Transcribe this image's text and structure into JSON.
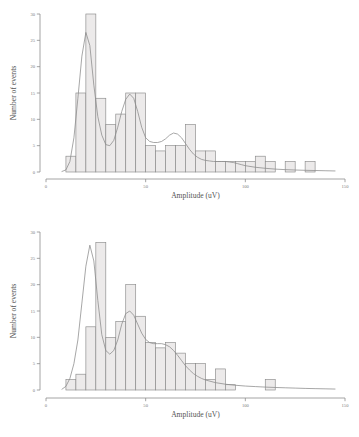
{
  "figure": {
    "background": "#ffffff",
    "bar_fill": "#ecebeb",
    "bar_stroke": "#8a8a8a",
    "curve_stroke": "#8a8a8a",
    "axis_color": "#8d8d8d"
  },
  "chart_data": [
    {
      "type": "bar",
      "id": "histogram-top",
      "title": "",
      "xlabel": "Amplitude (uV)",
      "ylabel": "Number of events",
      "xlim": [
        0,
        150
      ],
      "ylim": [
        0,
        30
      ],
      "xticks": [
        0,
        50,
        100,
        150
      ],
      "xtick_labels": [
        "0",
        "50",
        "100",
        "150"
      ],
      "yticks": [
        0,
        5,
        10,
        15,
        20,
        25,
        30
      ],
      "ytick_labels": [
        "0",
        "5",
        "10",
        "15",
        "20",
        "25",
        "30"
      ],
      "grid": false,
      "legend": "none",
      "bin_width": 5,
      "bin_starts": [
        10,
        15,
        20,
        25,
        30,
        35,
        40,
        45,
        50,
        55,
        60,
        65,
        70,
        75,
        80,
        85,
        90,
        95,
        100,
        105,
        110,
        115,
        120,
        125,
        130
      ],
      "categories": [
        "10-15",
        "15-20",
        "20-25",
        "25-30",
        "30-35",
        "35-40",
        "40-45",
        "45-50",
        "50-55",
        "55-60",
        "60-65",
        "65-70",
        "70-75",
        "75-80",
        "80-85",
        "85-90",
        "90-95",
        "95-100",
        "100-105",
        "105-110",
        "110-115",
        "115-120",
        "120-125",
        "125-130",
        "130-135"
      ],
      "values": [
        3,
        15,
        30,
        14,
        9,
        11,
        15,
        15,
        5,
        4,
        5,
        5,
        9,
        4,
        4,
        2,
        2,
        2,
        2,
        3,
        2,
        0,
        2,
        0,
        2
      ],
      "overlay_curve": {
        "name": "kernel density estimate",
        "x": [
          8,
          10,
          12,
          14,
          16,
          18,
          20,
          22,
          24,
          26,
          28,
          30,
          32,
          34,
          36,
          38,
          40,
          42,
          44,
          46,
          48,
          50,
          52,
          54,
          56,
          58,
          60,
          62,
          64,
          66,
          68,
          70,
          72,
          74,
          76,
          78,
          80,
          82,
          84,
          86,
          88,
          90,
          92,
          94,
          96,
          98,
          100,
          105,
          110,
          115,
          120,
          125,
          130,
          135,
          140,
          145
        ],
        "y": [
          0.1,
          0.4,
          2.0,
          6.5,
          14.0,
          22.0,
          26.5,
          24.0,
          16.5,
          10.5,
          7.0,
          5.2,
          5.0,
          6.0,
          8.5,
          11.5,
          13.8,
          14.8,
          14.0,
          11.5,
          8.5,
          6.5,
          5.8,
          5.6,
          5.6,
          5.8,
          6.3,
          7.0,
          7.4,
          7.2,
          6.5,
          5.4,
          4.3,
          3.4,
          2.8,
          2.4,
          2.2,
          2.1,
          2.0,
          2.0,
          2.0,
          2.0,
          1.9,
          1.8,
          1.6,
          1.4,
          1.2,
          0.9,
          0.7,
          0.55,
          0.45,
          0.38,
          0.32,
          0.28,
          0.24,
          0.2
        ]
      }
    },
    {
      "type": "bar",
      "id": "histogram-bottom",
      "title": "",
      "xlabel": "Amplitude (uV)",
      "ylabel": "Number of events",
      "xlim": [
        0,
        150
      ],
      "ylim": [
        0,
        30
      ],
      "xticks": [
        0,
        50,
        100,
        150
      ],
      "xtick_labels": [
        "0",
        "50",
        "100",
        "150"
      ],
      "yticks": [
        0,
        5,
        10,
        15,
        20,
        25,
        30
      ],
      "ytick_labels": [
        "0",
        "5",
        "10",
        "15",
        "20",
        "25",
        "30"
      ],
      "grid": false,
      "legend": "none",
      "bin_width": 5,
      "bin_starts": [
        10,
        15,
        20,
        25,
        30,
        35,
        40,
        45,
        50,
        55,
        60,
        65,
        70,
        75,
        80,
        85,
        90,
        110
      ],
      "categories": [
        "10-15",
        "15-20",
        "20-25",
        "25-30",
        "30-35",
        "35-40",
        "40-45",
        "45-50",
        "50-55",
        "55-60",
        "60-65",
        "65-70",
        "70-75",
        "75-80",
        "80-85",
        "85-90",
        "90-95",
        "110-115"
      ],
      "values": [
        2,
        3,
        12,
        28,
        10,
        13,
        20,
        14,
        9,
        8,
        9,
        7,
        5,
        5,
        2,
        4,
        1,
        2
      ],
      "overlay_curve": {
        "name": "kernel density estimate",
        "x": [
          8,
          10,
          12,
          14,
          16,
          18,
          20,
          22,
          24,
          26,
          28,
          30,
          32,
          34,
          36,
          38,
          40,
          42,
          44,
          46,
          48,
          50,
          52,
          54,
          56,
          58,
          60,
          62,
          64,
          66,
          68,
          70,
          72,
          74,
          76,
          78,
          80,
          85,
          90,
          95,
          100,
          105,
          110,
          115,
          120,
          125,
          130,
          135,
          140,
          145
        ],
        "y": [
          0.15,
          0.7,
          2.2,
          5.0,
          9.5,
          16.5,
          23.5,
          27.5,
          24.5,
          17.0,
          10.5,
          7.5,
          6.8,
          7.5,
          9.5,
          12.5,
          14.5,
          15.0,
          14.2,
          12.5,
          10.8,
          9.6,
          9.0,
          8.8,
          8.8,
          8.8,
          8.6,
          8.2,
          7.5,
          6.6,
          5.6,
          4.6,
          3.8,
          3.1,
          2.6,
          2.2,
          1.9,
          1.4,
          1.1,
          0.9,
          0.75,
          0.65,
          0.55,
          0.48,
          0.42,
          0.36,
          0.3,
          0.26,
          0.22,
          0.18
        ]
      }
    }
  ]
}
